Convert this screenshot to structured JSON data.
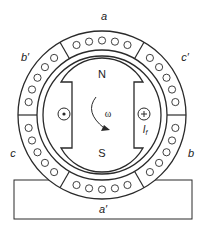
{
  "colors": {
    "stroke": "#2a2a2a",
    "background": "#ffffff",
    "text": "#222222"
  },
  "stator": {
    "phase_labels": {
      "a": "a",
      "a_prime": "a′",
      "b": "b",
      "b_prime": "b′",
      "c": "c",
      "c_prime": "c′"
    },
    "conductors_per_slot_group": 5,
    "slot_groups": 6
  },
  "rotor": {
    "north_pole": "N",
    "south_pole": "S",
    "rotation_symbol": "ω",
    "field_current_label": "I",
    "field_current_subscript": "f",
    "left_conductor": "dot-out-of-page",
    "right_conductor": "cross-into-page"
  },
  "base": {
    "label": "a′"
  }
}
